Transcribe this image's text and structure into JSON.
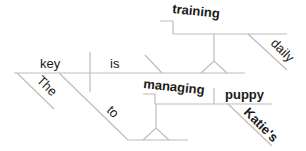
{
  "diagram": {
    "type": "sentence-diagram",
    "words": {
      "subject": "key",
      "verb": "is",
      "article": "The",
      "preposition": "to",
      "gerund": "managing",
      "object": "puppy",
      "possessive": "Katie's",
      "gerund_subject": "training",
      "adverb": "daily"
    },
    "colors": {
      "line": "#bdbdbd",
      "text": "#1a1a1a"
    }
  }
}
